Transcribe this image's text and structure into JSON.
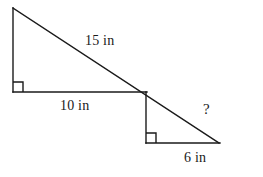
{
  "figure": {
    "background_color": "#ffffff",
    "stroke_color": "#1a1a1a",
    "stroke_width": 1.4,
    "labels": {
      "hypotenuse_upper": "15 in",
      "base_upper": "10 in",
      "base_lower": "6 in",
      "unknown": "?"
    },
    "units": "in",
    "points": {
      "top_left_apex": [
        13,
        8
      ],
      "left_base_corner": [
        13,
        92
      ],
      "junction": [
        146,
        92
      ],
      "lower_left_corner": [
        146,
        143
      ],
      "right_apex": [
        219,
        143
      ]
    },
    "right_angle_markers": [
      {
        "name": "upper-triangle-right-angle",
        "corner": [
          13,
          92
        ],
        "size": 10
      },
      {
        "name": "lower-triangle-right-angle",
        "corner": [
          146,
          143
        ],
        "size": 10
      }
    ],
    "segments": [
      {
        "name": "upper-vertical-leg",
        "from": [
          13,
          8
        ],
        "to": [
          13,
          92
        ]
      },
      {
        "name": "upper-horizontal-leg",
        "from": [
          13,
          92
        ],
        "to": [
          146,
          92
        ]
      },
      {
        "name": "lower-vertical-leg",
        "from": [
          146,
          92
        ],
        "to": [
          146,
          143
        ]
      },
      {
        "name": "lower-horizontal-leg",
        "from": [
          146,
          143
        ],
        "to": [
          219,
          143
        ]
      },
      {
        "name": "shared-hypotenuse",
        "from": [
          13,
          8
        ],
        "to": [
          219,
          143
        ]
      }
    ]
  }
}
